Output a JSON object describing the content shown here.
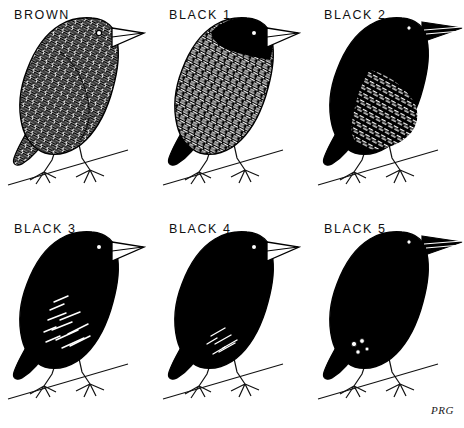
{
  "plate": {
    "title": "Finch plumage stage series",
    "background_color": "#ffffff",
    "ink_color": "#000000",
    "signature": "PRG",
    "columns": 3,
    "rows": 2
  },
  "panels": [
    {
      "label": "BROWN",
      "stage_index": 0,
      "plumage": "mottled brown streaked overall",
      "head_solid_black": false,
      "body_fill": "speckled",
      "beak_color": "pale outlined",
      "col": 0,
      "row": 0
    },
    {
      "label": "BLACK 1",
      "stage_index": 1,
      "plumage": "black head, heavily mottled body",
      "head_solid_black": true,
      "body_fill": "speckled",
      "beak_color": "pale outlined",
      "col": 1,
      "row": 0
    },
    {
      "label": "BLACK 2",
      "stage_index": 2,
      "plumage": "black head, breast and back; mottled flanks and belly",
      "head_solid_black": true,
      "body_fill": "part-solid",
      "beak_color": "pale outlined",
      "col": 2,
      "row": 0
    },
    {
      "label": "BLACK 3",
      "stage_index": 3,
      "plumage": "mostly black with light streaking on lower flank",
      "head_solid_black": true,
      "body_fill": "mostly-solid",
      "beak_color": "pale outlined",
      "col": 0,
      "row": 1
    },
    {
      "label": "BLACK 4",
      "stage_index": 4,
      "plumage": "black with slight streaking near vent",
      "head_solid_black": true,
      "body_fill": "nearly-solid",
      "beak_color": "pale outlined",
      "col": 1,
      "row": 1
    },
    {
      "label": "BLACK 5",
      "stage_index": 5,
      "plumage": "fully black plumage",
      "head_solid_black": true,
      "body_fill": "solid",
      "beak_color": "pale outlined",
      "col": 2,
      "row": 1
    }
  ]
}
